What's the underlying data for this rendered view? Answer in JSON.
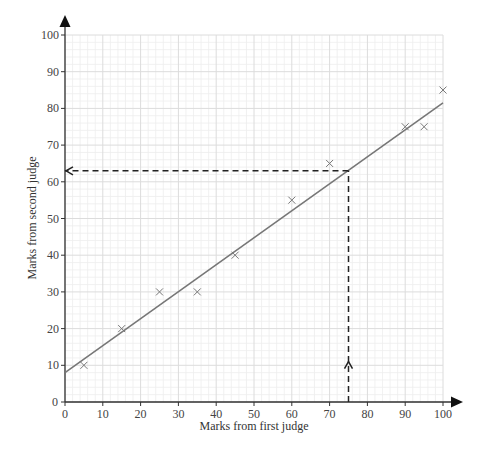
{
  "chart_data": {
    "type": "scatter",
    "title": "",
    "xlabel": "Marks from first judge",
    "ylabel": "Marks from second judge",
    "xlim": [
      0,
      100
    ],
    "ylim": [
      0,
      100
    ],
    "x_ticks": [
      0,
      10,
      20,
      30,
      40,
      50,
      60,
      70,
      80,
      90,
      100
    ],
    "y_ticks": [
      0,
      10,
      20,
      30,
      40,
      50,
      60,
      70,
      80,
      90,
      100
    ],
    "grid": {
      "major_step": 10,
      "minor_step": 2,
      "major_color": "#dcdcdc",
      "minor_color": "#eeeeee"
    },
    "series": [
      {
        "name": "Marks",
        "marker": "x",
        "color": "#777777",
        "points": [
          {
            "x": 5,
            "y": 10
          },
          {
            "x": 15,
            "y": 20
          },
          {
            "x": 25,
            "y": 30
          },
          {
            "x": 35,
            "y": 30
          },
          {
            "x": 45,
            "y": 40
          },
          {
            "x": 60,
            "y": 55
          },
          {
            "x": 70,
            "y": 65
          },
          {
            "x": 90,
            "y": 75
          },
          {
            "x": 95,
            "y": 75
          },
          {
            "x": 100,
            "y": 85
          }
        ]
      }
    ],
    "line_of_best_fit": {
      "x1": 0,
      "y1": 8,
      "x2": 100,
      "y2": 81.5,
      "color": "#777777"
    },
    "annotations": [
      {
        "type": "dashed-arrow",
        "description": "vertical dashed line from x=75 up to line",
        "from": {
          "x": 75,
          "y": 0
        },
        "to": {
          "x": 75,
          "y": 63
        },
        "arrow_at": {
          "x": 75,
          "y": 11
        },
        "arrow_dir": "up"
      },
      {
        "type": "dashed-arrow",
        "description": "horizontal dashed line from line to y-axis at y=63",
        "from": {
          "x": 75,
          "y": 63
        },
        "to": {
          "x": 0,
          "y": 63
        },
        "arrow_dir": "left"
      }
    ]
  }
}
